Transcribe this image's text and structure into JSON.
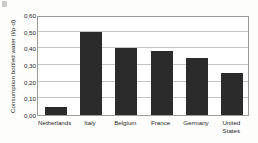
{
  "chart_data": {
    "type": "bar",
    "title": "",
    "xlabel": "",
    "ylabel": "Consumption bottled water (l/p·d)",
    "categories": [
      "Netherlands",
      "Italy",
      "Belgium",
      "France",
      "Germany",
      "United States"
    ],
    "category_lines": [
      [
        "Netherlands"
      ],
      [
        "Italy"
      ],
      [
        "Belgium"
      ],
      [
        "France"
      ],
      [
        "Germany"
      ],
      [
        "United",
        "States"
      ]
    ],
    "values": [
      0.05,
      0.5,
      0.405,
      0.385,
      0.34,
      0.25
    ],
    "ylim": [
      0.0,
      0.6
    ],
    "ytick_values": [
      0.6,
      0.5,
      0.4,
      0.3,
      0.2,
      0.1,
      0.0
    ],
    "ytick_labels": [
      "0,60",
      "0,50",
      "0,40",
      "0,30",
      "0,20",
      "0,10",
      "0,00"
    ],
    "grid": true,
    "legend": null,
    "bar_color": "#2b2b2b",
    "gridline_color": "#c3c3c0",
    "frame_color": "#9a9a97",
    "plot_background": "#ffffff",
    "page_background": "#fdfdfc",
    "text_color": "#1f1f1f"
  }
}
